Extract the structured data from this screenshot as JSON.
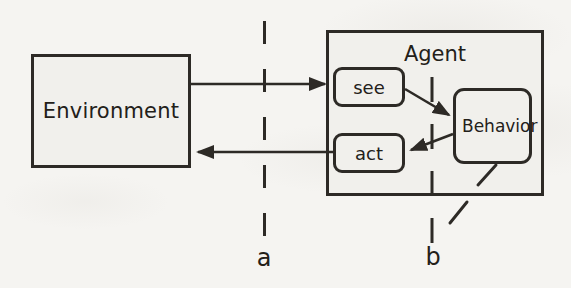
{
  "diagram": {
    "nodes": {
      "environment": {
        "label": "Environment"
      },
      "agent": {
        "label": "Agent"
      },
      "see": {
        "label": "see"
      },
      "act": {
        "label": "act"
      },
      "behavior": {
        "label": "Behavior"
      }
    },
    "boundaries": {
      "a": {
        "label": "a"
      },
      "b": {
        "label": "b"
      }
    },
    "colors": {
      "ink": "#2d2a26",
      "paper": "#f5f4f1",
      "box_fill": "#f1f0ec",
      "text": "#232019"
    }
  }
}
